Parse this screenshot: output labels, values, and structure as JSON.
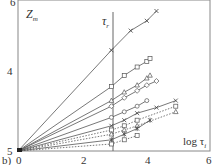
{
  "chart_data": {
    "type": "line",
    "panel_label": "b)",
    "title": "",
    "xlabel": "log τ_i",
    "ylabel": "Z_m",
    "annotation": "τ_r",
    "annotation_x": 2.9,
    "xlim": [
      0,
      6
    ],
    "ylim": [
      5,
      6
    ],
    "x_ticks": [
      "0",
      "2",
      "4",
      "6"
    ],
    "y_ticks": [
      "5",
      "4",
      "6"
    ],
    "grid": false,
    "series": [
      {
        "name": "s1",
        "marker": "x",
        "style": "solid",
        "points": [
          [
            0,
            0
          ],
          [
            2.9,
            0.72
          ],
          [
            3.5,
            0.86
          ],
          [
            4.0,
            0.93
          ],
          [
            4.3,
            1.0
          ]
        ]
      },
      {
        "name": "s2",
        "marker": "square",
        "style": "solid",
        "points": [
          [
            0,
            0
          ],
          [
            2.9,
            0.46
          ],
          [
            3.3,
            0.54
          ],
          [
            3.7,
            0.6
          ],
          [
            4.0,
            0.64
          ],
          [
            4.1,
            0.66
          ]
        ]
      },
      {
        "name": "s3",
        "marker": "triangle",
        "style": "solid",
        "points": [
          [
            0,
            0
          ],
          [
            2.9,
            0.36
          ],
          [
            3.3,
            0.42
          ],
          [
            3.7,
            0.47
          ],
          [
            4.0,
            0.52
          ],
          [
            4.1,
            0.54
          ]
        ]
      },
      {
        "name": "s4",
        "marker": "diamond",
        "style": "solid",
        "points": [
          [
            0,
            0
          ],
          [
            2.9,
            0.32
          ],
          [
            3.3,
            0.38
          ],
          [
            3.7,
            0.43
          ],
          [
            4.0,
            0.47
          ],
          [
            4.3,
            0.5
          ]
        ]
      },
      {
        "name": "s5",
        "marker": "circle",
        "style": "solid",
        "points": [
          [
            0,
            0
          ],
          [
            2.9,
            0.24
          ],
          [
            3.3,
            0.28
          ],
          [
            3.7,
            0.32
          ],
          [
            4.0,
            0.36
          ]
        ]
      },
      {
        "name": "s6",
        "marker": "x",
        "style": "solid",
        "points": [
          [
            0,
            0
          ],
          [
            2.9,
            0.18
          ],
          [
            3.3,
            0.22
          ],
          [
            3.7,
            0.27
          ],
          [
            4.3,
            0.31
          ],
          [
            4.9,
            0.36
          ]
        ]
      },
      {
        "name": "s7",
        "marker": "square",
        "style": "dotted",
        "points": [
          [
            0,
            0
          ],
          [
            2.9,
            0.15
          ],
          [
            3.3,
            0.18
          ],
          [
            3.7,
            0.22
          ],
          [
            4.9,
            0.32
          ]
        ]
      },
      {
        "name": "s8",
        "marker": "triangle",
        "style": "dotted",
        "points": [
          [
            0,
            0
          ],
          [
            2.9,
            0.12
          ],
          [
            3.3,
            0.15
          ],
          [
            3.7,
            0.18
          ],
          [
            4.9,
            0.28
          ]
        ]
      },
      {
        "name": "s9",
        "marker": "asterisk",
        "style": "solid",
        "points": [
          [
            0,
            0
          ],
          [
            2.9,
            0.08
          ],
          [
            3.3,
            0.12
          ],
          [
            3.7,
            0.16
          ],
          [
            4.1,
            0.22
          ]
        ]
      },
      {
        "name": "s10",
        "marker": "square",
        "style": "dotted",
        "points": [
          [
            0,
            0
          ],
          [
            2.9,
            0.05
          ],
          [
            3.3,
            0.08
          ],
          [
            3.7,
            0.11
          ]
        ]
      }
    ]
  },
  "labels": {
    "panel": "b)",
    "ylabel": "Z",
    "ylabel_sub": "m",
    "annot": "τ",
    "annot_sub": "r",
    "xlabel": "log τ",
    "xlabel_sub": "i",
    "xt0": "0",
    "xt2": "2",
    "xt4": "4",
    "xt6": "6",
    "yt5": "5",
    "yt4": "4",
    "yt6": "6"
  }
}
